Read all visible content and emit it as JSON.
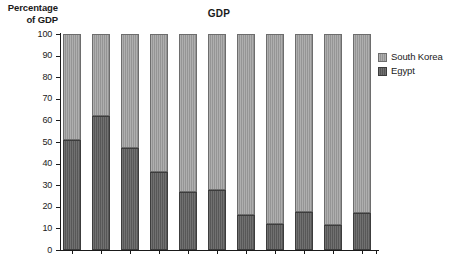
{
  "chart_data": {
    "type": "bar",
    "subtype": "stacked-100-percent",
    "title": "GDP",
    "xlabel": "",
    "ylabel_line1": "Percentage",
    "ylabel_line2": "of GDP",
    "ylim": [
      0,
      100
    ],
    "ytick_step": 10,
    "yticks": [
      0,
      10,
      20,
      30,
      40,
      50,
      60,
      70,
      80,
      90,
      100
    ],
    "grid": false,
    "legend_position": "right",
    "categories": [
      "1960",
      "1965",
      "1970",
      "1975",
      "1980",
      "1985",
      "1990",
      "1995",
      "2000",
      "2005",
      "2008"
    ],
    "series": [
      {
        "name": "South Korea",
        "color": "#9b9b9b",
        "values": [
          49,
          38,
          53,
          64,
          73,
          72,
          84,
          88,
          82.5,
          88.5,
          83
        ]
      },
      {
        "name": "Egypt",
        "color": "#5c5c5c",
        "values": [
          51,
          62,
          47,
          36,
          27,
          28,
          16,
          12,
          17.5,
          11.5,
          17
        ]
      }
    ],
    "stack_order_bottom_to_top": [
      "Egypt",
      "South Korea"
    ]
  },
  "legend": {
    "items": [
      {
        "label": "South Korea",
        "swatch_class": "sk"
      },
      {
        "label": "Egypt",
        "swatch_class": "eg"
      }
    ]
  }
}
